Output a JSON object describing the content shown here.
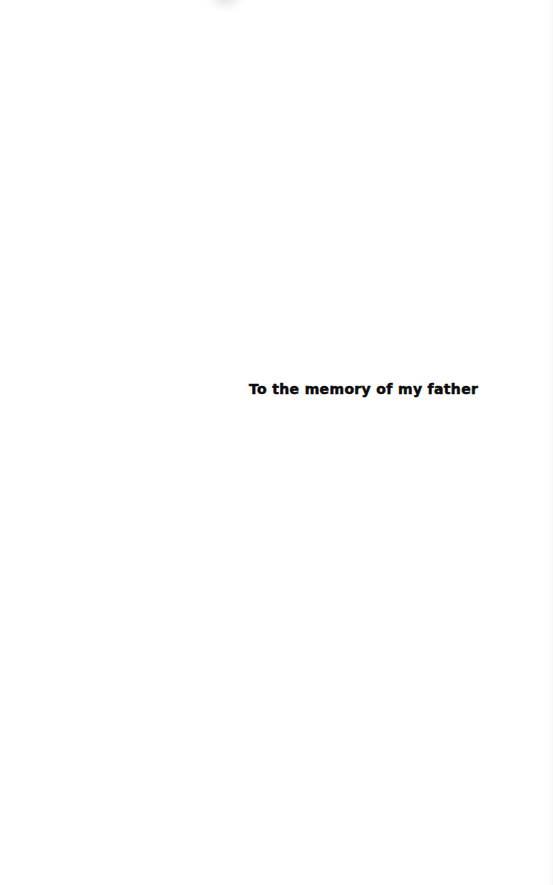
{
  "page": {
    "type": "dedication",
    "background_color": "#ffffff",
    "text_color": "#0a0a0a"
  },
  "dedication": {
    "text": "To the memory of my father"
  }
}
